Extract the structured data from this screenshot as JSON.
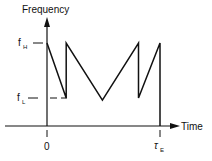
{
  "chart_data": {
    "type": "line",
    "title": "",
    "xlabel": "Time",
    "ylabel": "Frequency",
    "y_ticks": [
      {
        "label": "f",
        "sub": "H",
        "value": "high"
      },
      {
        "label": "f",
        "sub": "L",
        "value": "low"
      }
    ],
    "x_ticks": [
      {
        "label": "0",
        "value": 0
      },
      {
        "label": "τ",
        "sub": "E",
        "value": 1
      }
    ],
    "series": [
      {
        "name": "frequency sweep",
        "points": [
          {
            "t": 0.0,
            "f": 1.0
          },
          {
            "t": 0.17,
            "f": 0.0
          },
          {
            "t": 0.17,
            "f": 1.0
          },
          {
            "t": 0.49,
            "f": -0.04
          },
          {
            "t": 0.81,
            "f": 1.0
          },
          {
            "t": 0.81,
            "f": 0.0
          },
          {
            "t": 1.0,
            "f": 1.0
          },
          {
            "t": 1.0,
            "f": -0.5
          }
        ]
      }
    ]
  },
  "labels": {
    "y_axis": "Frequency",
    "x_axis": "Time",
    "fH": "f",
    "fH_sub": "H",
    "fL": "f",
    "fL_sub": "L",
    "zero": "0",
    "tauE": "τ",
    "tauE_sub": "E"
  }
}
